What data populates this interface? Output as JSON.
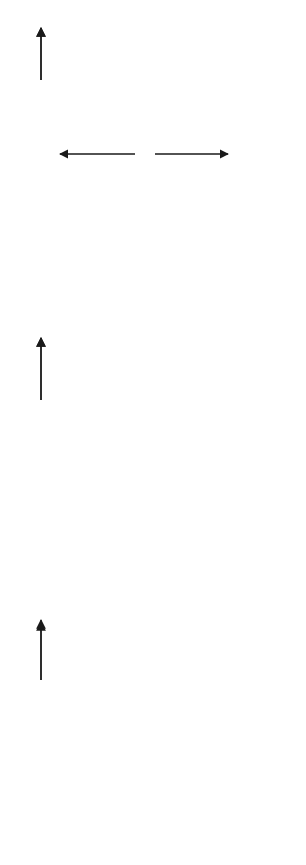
{
  "diagram": {
    "type": "why-why diagram",
    "problem": {
      "label_line1": "PROBLEM:",
      "label_line2": "Late completion",
      "label_line3": "of report"
    },
    "why_label": "Why?",
    "nodes": {
      "graphics_not_ready": {
        "line1": "Graphics",
        "line2": "not ready"
      },
      "information_not_available": {
        "line1": "Information",
        "line2": "not available"
      },
      "poor_graphics_system": {
        "line1": "Poor graphics",
        "line2": "system"
      },
      "people_wont_work_overtime": {
        "line1": "People wouldn't",
        "line2": "work overtime"
      },
      "accounting_didnt_provide_data": {
        "line1": "Accounting didn't",
        "line2": "provide data"
      },
      "outdated_technology": {
        "line1": "Outdated",
        "line2": "technology"
      },
      "already_overworked": {
        "line1": "Already",
        "line2": "overworked"
      },
      "other_projects_more_important": {
        "line1": "Other projects",
        "line2": "more important"
      },
      "management_unaware": {
        "line1": "Management unaware of",
        "line2": "need for improvements"
      },
      "inadequate_staffing": {
        "line1": "Inadequate",
        "line2": "staffing"
      },
      "dont_understand_priorities": {
        "line1": "Don't understand",
        "line2": "corporate priorities"
      },
      "corporate_downsizing": {
        "line1": "Corporate",
        "line2": "downsizing"
      },
      "lack_of_communication": {
        "line1": "Lack of",
        "line2": "communication"
      }
    },
    "edges": [
      {
        "from": "problem",
        "to": "graphics_not_ready",
        "label": "Why?"
      },
      {
        "from": "problem",
        "to": "information_not_available",
        "label": "Why?"
      },
      {
        "from": "graphics_not_ready",
        "to": "poor_graphics_system",
        "label": "Why?"
      },
      {
        "from": "graphics_not_ready",
        "to": "people_wont_work_overtime",
        "label": ""
      },
      {
        "from": "information_not_available",
        "to": "people_wont_work_overtime",
        "label": ""
      },
      {
        "from": "information_not_available",
        "to": "accounting_didnt_provide_data",
        "label": "Why?"
      },
      {
        "from": "poor_graphics_system",
        "to": "outdated_technology",
        "label": "Why?"
      },
      {
        "from": "people_wont_work_overtime",
        "to": "already_overworked",
        "label": "Why?"
      },
      {
        "from": "accounting_didnt_provide_data",
        "to": "other_projects_more_important",
        "label": "Why?"
      },
      {
        "from": "outdated_technology",
        "to": "management_unaware",
        "label": "Why?"
      },
      {
        "from": "already_overworked",
        "to": "inadequate_staffing",
        "label": "Why?"
      },
      {
        "from": "other_projects_more_important",
        "to": "dont_understand_priorities",
        "label": "Why?"
      },
      {
        "from": "inadequate_staffing",
        "to": "corporate_downsizing",
        "label": "Why?"
      },
      {
        "from": "dont_understand_priorities",
        "to": "lack_of_communication",
        "label": "Why?"
      }
    ]
  },
  "caption": {
    "figure_number": "Figure 5.3",
    "title": "Why-why diagram"
  }
}
